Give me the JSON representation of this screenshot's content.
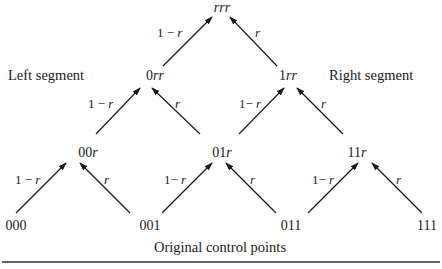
{
  "diagram": {
    "type": "de Casteljau blossom triangle",
    "segment_labels": {
      "left": "Left segment",
      "right": "Right segment"
    },
    "caption": "Original control points",
    "nodes": [
      {
        "id": "rrr",
        "prefix": "",
        "italic": "rrr",
        "x": 222,
        "y": 13
      },
      {
        "id": "0rr",
        "prefix": "0",
        "italic": "rr",
        "x": 155,
        "y": 80
      },
      {
        "id": "1rr",
        "prefix": "1",
        "italic": "rr",
        "x": 288,
        "y": 80
      },
      {
        "id": "00r",
        "prefix": "00",
        "italic": "r",
        "x": 88,
        "y": 157
      },
      {
        "id": "01r",
        "prefix": "01",
        "italic": "r",
        "x": 222,
        "y": 157
      },
      {
        "id": "11r",
        "prefix": "11",
        "italic": "r",
        "x": 355,
        "y": 157
      },
      {
        "id": "000",
        "prefix": "000",
        "italic": "",
        "x": 16,
        "y": 231
      },
      {
        "id": "001",
        "prefix": "001",
        "italic": "",
        "x": 150,
        "y": 231
      },
      {
        "id": "011",
        "prefix": "011",
        "italic": "",
        "x": 291,
        "y": 231
      },
      {
        "id": "111",
        "prefix": "111",
        "italic": "",
        "x": 427,
        "y": 231
      }
    ],
    "edges": [
      {
        "from": "0rr",
        "to": "rrr",
        "weight": "1 − r"
      },
      {
        "from": "1rr",
        "to": "rrr",
        "weight": "r"
      },
      {
        "from": "00r",
        "to": "0rr",
        "weight": "1 − r"
      },
      {
        "from": "01r",
        "to": "0rr",
        "weight": "r"
      },
      {
        "from": "01r",
        "to": "1rr",
        "weight": "1− r"
      },
      {
        "from": "11r",
        "to": "1rr",
        "weight": "r"
      },
      {
        "from": "000",
        "to": "00r",
        "weight": "1 − r"
      },
      {
        "from": "001",
        "to": "00r",
        "weight": "r"
      },
      {
        "from": "001",
        "to": "01r",
        "weight": "1− r"
      },
      {
        "from": "011",
        "to": "01r",
        "weight": "r"
      },
      {
        "from": "011",
        "to": "11r",
        "weight": "1− r"
      },
      {
        "from": "111",
        "to": "11r",
        "weight": "r"
      }
    ],
    "weight_labels": {
      "one_minus_r_prefix": "1 − ",
      "one_minus_r_tight_prefix": "1− ",
      "r": "r"
    },
    "colors": {
      "ink": "#1a1a1a",
      "rule": "#333333",
      "background": "#ffffff"
    }
  }
}
